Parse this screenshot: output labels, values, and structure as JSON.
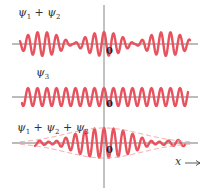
{
  "panels": [
    {
      "label_parts": [
        "ψ",
        "1",
        " + ψ",
        "2"
      ],
      "label": "ψ1 + ψ2",
      "origin": "0"
    },
    {
      "label_parts": [
        "ψ",
        "3"
      ],
      "label": "ψ3",
      "origin": "0"
    },
    {
      "label_parts": [
        "ψ",
        "1",
        " + ψ",
        "2",
        " + ψ",
        "3"
      ],
      "label": "ψ1 + ψ2 + ψ3",
      "origin": "0"
    }
  ],
  "x_axis_label": "x",
  "colors": {
    "wave": "#e8525e",
    "axis": "#555555",
    "envelope": "#f0a0a0"
  }
}
